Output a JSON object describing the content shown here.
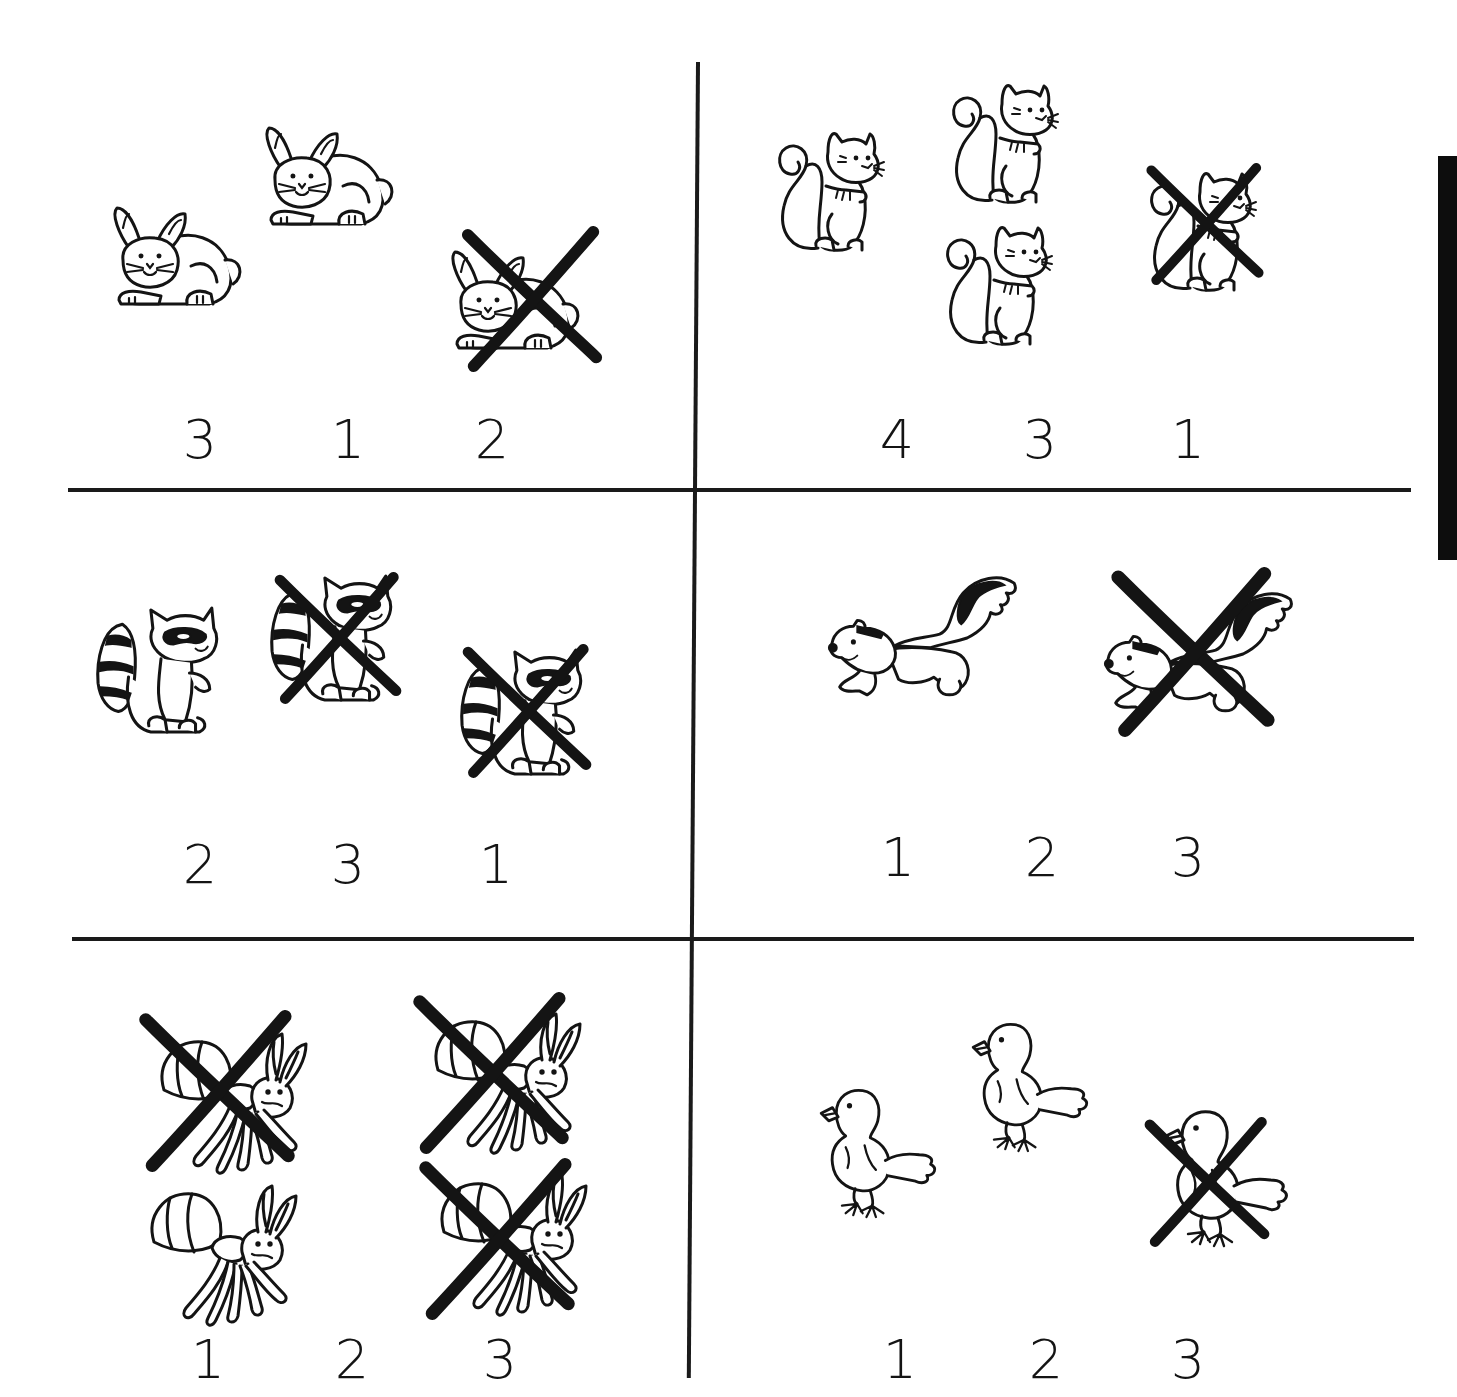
{
  "worksheet": {
    "ink_color": "#141414",
    "paper_color": "#ffffff",
    "cells": [
      {
        "id": "rabbits",
        "animal": "rabbit",
        "total": 3,
        "crossed_out": 1,
        "remaining": 2,
        "choices": [
          "3",
          "1",
          "2"
        ]
      },
      {
        "id": "squirrels",
        "animal": "squirrel",
        "total": 4,
        "crossed_out": 1,
        "remaining": 3,
        "choices": [
          "4",
          "3",
          "1"
        ]
      },
      {
        "id": "raccoons",
        "animal": "raccoon",
        "total": 3,
        "crossed_out": 2,
        "remaining": 1,
        "choices": [
          "2",
          "3",
          "1"
        ]
      },
      {
        "id": "skunks",
        "animal": "skunk",
        "total": 2,
        "crossed_out": 1,
        "remaining": 1,
        "choices": [
          "1",
          "2",
          "3"
        ]
      },
      {
        "id": "ants",
        "animal": "ant",
        "total": 4,
        "crossed_out": 3,
        "remaining": 1,
        "choices": [
          "1",
          "2",
          "3"
        ]
      },
      {
        "id": "chicks",
        "animal": "chick",
        "total": 3,
        "crossed_out": 1,
        "remaining": 2,
        "choices": [
          "1",
          "2",
          "3"
        ]
      }
    ]
  }
}
